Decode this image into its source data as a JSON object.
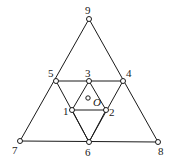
{
  "diagram": {
    "title": "",
    "nodes": [
      {
        "id": "1",
        "label": "1",
        "x": 72,
        "y": 110,
        "lx": 63,
        "ly": 115
      },
      {
        "id": "2",
        "label": "2",
        "x": 106,
        "y": 110,
        "lx": 109,
        "ly": 116
      },
      {
        "id": "3",
        "label": "3",
        "x": 89,
        "y": 81,
        "lx": 85,
        "ly": 77
      },
      {
        "id": "4",
        "label": "4",
        "x": 123,
        "y": 81,
        "lx": 126,
        "ly": 77
      },
      {
        "id": "5",
        "label": "5",
        "x": 56,
        "y": 81,
        "lx": 48,
        "ly": 77
      },
      {
        "id": "6",
        "label": "6",
        "x": 89,
        "y": 142,
        "lx": 85,
        "ly": 156
      },
      {
        "id": "7",
        "label": "7",
        "x": 20,
        "y": 141,
        "lx": 12,
        "ly": 154
      },
      {
        "id": "8",
        "label": "8",
        "x": 158,
        "y": 142,
        "lx": 158,
        "ly": 155
      },
      {
        "id": "9",
        "label": "9",
        "x": 89,
        "y": 19,
        "lx": 85,
        "ly": 14
      }
    ],
    "edges": [
      [
        "9",
        "7"
      ],
      [
        "9",
        "8"
      ],
      [
        "7",
        "8"
      ],
      [
        "5",
        "4"
      ],
      [
        "5",
        "6"
      ],
      [
        "4",
        "6"
      ],
      [
        "3",
        "1"
      ],
      [
        "3",
        "2"
      ],
      [
        "1",
        "2"
      ],
      [
        "1",
        "6"
      ],
      [
        "2",
        "6"
      ]
    ],
    "center": {
      "label": "O",
      "x": 88,
      "y": 98,
      "lx": 93,
      "ly": 106
    }
  }
}
